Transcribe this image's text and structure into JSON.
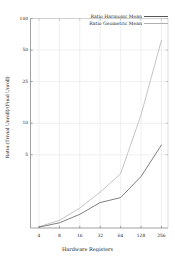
{
  "chart_data": {
    "type": "line",
    "title": "",
    "xlabel": "Hardware Registers",
    "ylabel": "Ratio:(Trivial Unroll)/(Final Unroll)",
    "xscale": "log2",
    "yscale": "log",
    "xlim": [
      3,
      320
    ],
    "ylim": [
      1,
      100
    ],
    "grid": true,
    "legend_position": "top-right",
    "x": [
      4,
      8,
      16,
      32,
      64,
      128,
      256
    ],
    "xticks": [
      "4",
      "8",
      "16",
      "32",
      "64",
      "128",
      "256"
    ],
    "yticks": [
      "5",
      "10",
      "25",
      "50",
      "100"
    ],
    "ytick_values": [
      5,
      10,
      25,
      50,
      100
    ],
    "series": [
      {
        "name": "Ratio Harmonic Mean",
        "color": "#555555",
        "values": [
          1.02,
          1.12,
          1.35,
          1.75,
          1.95,
          3.1,
          6.2
        ]
      },
      {
        "name": "Ratio Geometric Mean",
        "color": "#b0b0b0",
        "values": [
          1.03,
          1.18,
          1.55,
          2.2,
          3.3,
          12.0,
          62.0
        ]
      }
    ]
  },
  "axes": {
    "xlabel": "Hardware Registers",
    "ylabel": "Ratio:(Trivial Unroll)/(Final Unroll)"
  },
  "legend": {
    "entries": [
      {
        "label": "Ratio Harmonic Mean"
      },
      {
        "label": "Ratio Geometric Mean"
      }
    ]
  }
}
